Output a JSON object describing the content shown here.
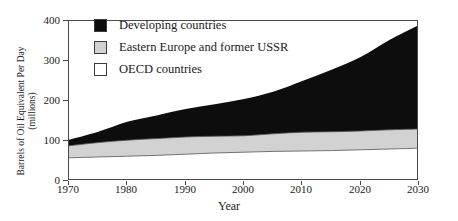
{
  "chart_data": {
    "type": "area",
    "title": "",
    "subtitle": "",
    "xlabel": "Year",
    "ylabel": "Barrels of Oil Equivalent Per Day",
    "ylabel_line2": "(millions)",
    "stacked": true,
    "grid": false,
    "legend_position": "upper-left-inside",
    "x": [
      1970,
      1975,
      1980,
      1985,
      1990,
      1995,
      2000,
      2005,
      2010,
      2015,
      2020,
      2025,
      2030
    ],
    "xlim": [
      1970,
      2030
    ],
    "ylim": [
      0,
      400
    ],
    "xticks": [
      1970,
      1980,
      1990,
      2000,
      2010,
      2020,
      2030
    ],
    "yticks": [
      0,
      100,
      200,
      300,
      400
    ],
    "xtick_labels": [
      "1970",
      "1980",
      "1990",
      "2000",
      "2010",
      "2020",
      "2030"
    ],
    "ytick_labels": [
      "0",
      "100",
      "200",
      "300",
      "400"
    ],
    "series": [
      {
        "name": "OECD countries",
        "color": "#ffffff",
        "edge_color": "#555555",
        "values": [
          58,
          60,
          62,
          64,
          67,
          70,
          72,
          74,
          75,
          76,
          78,
          80,
          82
        ]
      },
      {
        "name": "Eastern Europe and former USSR",
        "color": "#d2d2d2",
        "edge_color": "#555555",
        "values": [
          30,
          36,
          40,
          42,
          43,
          42,
          41,
          44,
          47,
          47,
          47,
          48,
          48
        ]
      },
      {
        "name": "Developing countries",
        "color": "#0d0d0d",
        "edge_color": "#0d0d0d",
        "values": [
          15,
          27,
          46,
          58,
          70,
          80,
          92,
          105,
          128,
          155,
          185,
          225,
          260
        ]
      }
    ],
    "cumulative_tops": {
      "oecd": [
        58,
        60,
        62,
        64,
        67,
        70,
        72,
        74,
        75,
        76,
        78,
        80,
        82
      ],
      "eastern_europe": [
        88,
        96,
        102,
        106,
        110,
        112,
        113,
        118,
        122,
        123,
        125,
        128,
        130
      ],
      "total": [
        103,
        123,
        148,
        164,
        180,
        192,
        205,
        223,
        250,
        278,
        310,
        353,
        390
      ]
    }
  },
  "legend": {
    "items": [
      {
        "label": "Developing countries",
        "swatch": "#0d0d0d"
      },
      {
        "label": "Eastern Europe and former USSR",
        "swatch": "#d2d2d2"
      },
      {
        "label": "OECD countries",
        "swatch": "#ffffff"
      }
    ]
  },
  "axes": {
    "y_title_line1": "Barrels of Oil Equivalent Per Day",
    "y_title_line2": "(millions)",
    "x_title": "Year",
    "y_ticks": [
      "400",
      "300",
      "200",
      "100",
      "0"
    ],
    "x_ticks": [
      "1970",
      "1980",
      "1990",
      "2000",
      "2010",
      "2020",
      "2030"
    ]
  }
}
